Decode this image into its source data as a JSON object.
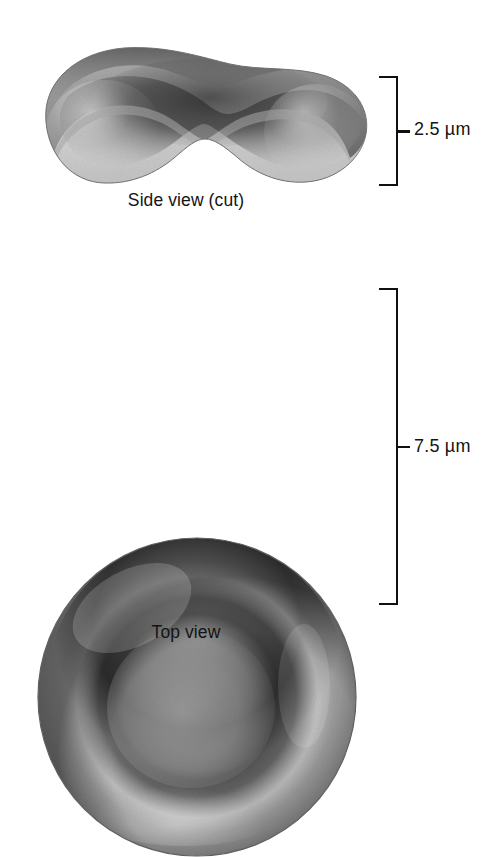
{
  "figure": {
    "background_color": "#ffffff",
    "ink_color": "#141414"
  },
  "panels": [
    {
      "id": "side-view",
      "caption": "Side view (cut)",
      "measurement": {
        "value": "2.5",
        "unit": "µm",
        "label": "2.5 µm",
        "axis": "thickness"
      },
      "cell": {
        "shape": "biconcave-disc-cut-section",
        "cut_face_color": "#d2d2d2",
        "outer_surface_color": "#8b8b8b",
        "shadow_color": "#2e2e2e"
      }
    },
    {
      "id": "top-view",
      "caption": "Top view",
      "measurement": {
        "value": "7.5",
        "unit": "µm",
        "label": "7.5 µm",
        "axis": "diameter"
      },
      "cell": {
        "shape": "biconcave-disc-circular",
        "rim_color": "#9a9a9a",
        "groove_color": "#343434",
        "center_color": "#8a8a8a",
        "edge_color": "#4a4a4a"
      }
    }
  ]
}
